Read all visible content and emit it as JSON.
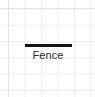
{
  "canvas": {
    "width": 95,
    "height": 97,
    "background_color": "#ffffff"
  },
  "grid": {
    "line_color": "#eceded",
    "edge_line_color": "#e4e5e6",
    "cell_width": 16.5,
    "cell_height": 16.3,
    "offset_x": 8,
    "offset_y": 8.5,
    "visible": true
  },
  "legend": {
    "entries": [
      {
        "symbol_name": "fence-line-symbol",
        "symbol_type": "thick-horizontal-line",
        "symbol_color": "#141414",
        "symbol_width": 47,
        "symbol_thickness": 3,
        "label": "Fence",
        "label_color": "#2b2b2b"
      }
    ]
  }
}
